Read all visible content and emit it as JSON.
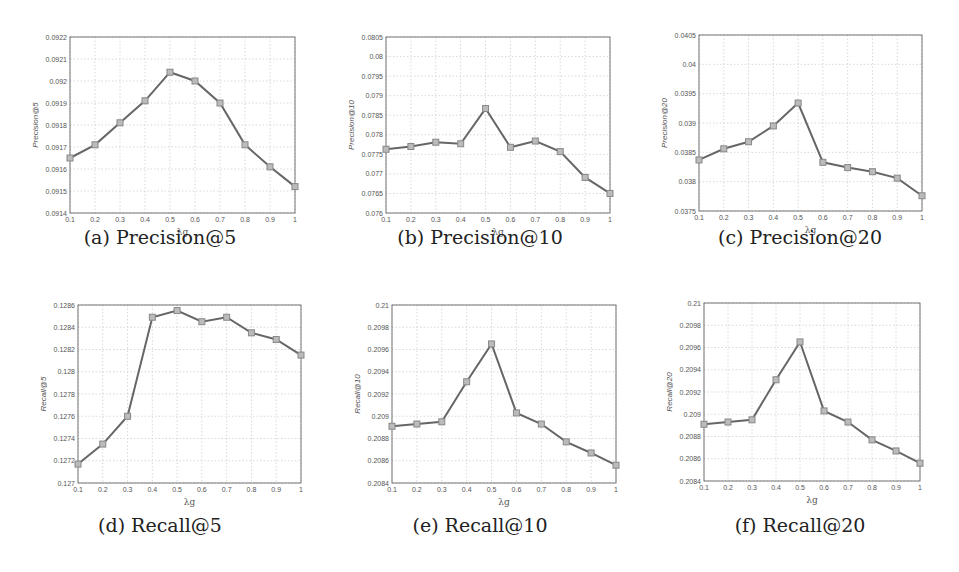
{
  "figure": {
    "x_axis_label": "λg",
    "x_ticks": [
      "0.1",
      "0.2",
      "0.3",
      "0.4",
      "0.5",
      "0.6",
      "0.7",
      "0.8",
      "0.9",
      "1"
    ],
    "line_color": "#666666",
    "marker_color": "#888888"
  },
  "chart_data": [
    {
      "type": "line",
      "caption": "(a) Precision@5",
      "title": "",
      "xlabel": "λg",
      "ylabel": "Precision@5",
      "x": [
        0.1,
        0.2,
        0.3,
        0.4,
        0.5,
        0.6,
        0.7,
        0.8,
        0.9,
        1.0
      ],
      "values": [
        0.09165,
        0.09171,
        0.09181,
        0.09191,
        0.09204,
        0.092,
        0.0919,
        0.09171,
        0.09161,
        0.09152
      ],
      "ylim": [
        0.0914,
        0.0922
      ],
      "y_ticks": [
        "0.0914",
        "0.0915",
        "0.0916",
        "0.0917",
        "0.0918",
        "0.0919",
        "0.092",
        "0.0921",
        "0.0922"
      ],
      "grid": true,
      "marker": "square"
    },
    {
      "type": "line",
      "caption": "(b) Precision@10",
      "title": "",
      "xlabel": "λg",
      "ylabel": "Precision@10",
      "x": [
        0.1,
        0.2,
        0.3,
        0.4,
        0.5,
        0.6,
        0.7,
        0.8,
        0.9,
        1.0
      ],
      "values": [
        0.07763,
        0.0777,
        0.07781,
        0.07777,
        0.07867,
        0.07768,
        0.07784,
        0.07757,
        0.07691,
        0.0765
      ],
      "ylim": [
        0.076,
        0.0805
      ],
      "y_ticks": [
        "0.076",
        "0.0765",
        "0.077",
        "0.0775",
        "0.078",
        "0.0785",
        "0.079",
        "0.0795",
        "0.08",
        "0.0805"
      ],
      "grid": true,
      "marker": "square"
    },
    {
      "type": "line",
      "caption": "(c) Precision@20",
      "title": "",
      "xlabel": "λg",
      "ylabel": "Precision@20",
      "x": [
        0.1,
        0.2,
        0.3,
        0.4,
        0.5,
        0.6,
        0.7,
        0.8,
        0.9,
        1.0
      ],
      "values": [
        0.03837,
        0.03856,
        0.03868,
        0.03895,
        0.03934,
        0.03833,
        0.03824,
        0.03817,
        0.03806,
        0.03776
      ],
      "ylim": [
        0.0375,
        0.0405
      ],
      "y_ticks": [
        "0.0375",
        "0.038",
        "0.0385",
        "0.039",
        "0.0395",
        "0.04",
        "0.0405"
      ],
      "grid": true,
      "marker": "square"
    },
    {
      "type": "line",
      "caption": "(d) Recall@5",
      "title": "",
      "xlabel": "λg",
      "ylabel": "Recall@5",
      "x": [
        0.1,
        0.2,
        0.3,
        0.4,
        0.5,
        0.6,
        0.7,
        0.8,
        0.9,
        1.0
      ],
      "values": [
        0.12717,
        0.12735,
        0.1276,
        0.12849,
        0.12855,
        0.12845,
        0.12849,
        0.12835,
        0.12829,
        0.12815
      ],
      "ylim": [
        0.127,
        0.1286
      ],
      "y_ticks": [
        "0.127",
        "0.1272",
        "0.1274",
        "0.1276",
        "0.1278",
        "0.128",
        "0.1282",
        "0.1284",
        "0.1286"
      ],
      "grid": true,
      "marker": "square"
    },
    {
      "type": "line",
      "caption": "(e) Recall@10",
      "title": "",
      "xlabel": "λg",
      "ylabel": "Recall@10",
      "x": [
        0.1,
        0.2,
        0.3,
        0.4,
        0.5,
        0.6,
        0.7,
        0.8,
        0.9,
        1.0
      ],
      "values": [
        0.20891,
        0.20893,
        0.20895,
        0.20931,
        0.20965,
        0.20903,
        0.20893,
        0.20877,
        0.20867,
        0.20856
      ],
      "ylim": [
        0.2084,
        0.21
      ],
      "y_ticks": [
        "0.2084",
        "0.2086",
        "0.2088",
        "0.209",
        "0.2092",
        "0.2094",
        "0.2096",
        "0.2098",
        "0.21"
      ],
      "grid": true,
      "marker": "square"
    },
    {
      "type": "line",
      "caption": "(f) Recall@20",
      "title": "",
      "xlabel": "λg",
      "ylabel": "Recall@20",
      "x": [
        0.1,
        0.2,
        0.3,
        0.4,
        0.5,
        0.6,
        0.7,
        0.8,
        0.9,
        1.0
      ],
      "values": [
        0.20891,
        0.20893,
        0.20895,
        0.20931,
        0.20965,
        0.20903,
        0.20893,
        0.20877,
        0.20867,
        0.20856
      ],
      "ylim": [
        0.2084,
        0.21
      ],
      "y_ticks": [
        "0.2084",
        "0.2086",
        "0.2088",
        "0.209",
        "0.2092",
        "0.2094",
        "0.2096",
        "0.2098",
        "0.21"
      ],
      "grid": true,
      "marker": "square"
    }
  ],
  "layout": {
    "panels": [
      {
        "left": 0,
        "top": 0,
        "plot": {
          "x": 70,
          "y": 37,
          "w": 225,
          "h": 176
        },
        "caption_top": 226
      },
      {
        "left": 320,
        "top": 0,
        "plot": {
          "x": 66,
          "y": 37,
          "w": 224,
          "h": 176
        },
        "caption_top": 226
      },
      {
        "left": 640,
        "top": 0,
        "plot": {
          "x": 59,
          "y": 35,
          "w": 223,
          "h": 176
        },
        "caption_top": 226
      },
      {
        "left": 0,
        "top": 290,
        "plot": {
          "x": 78,
          "y": 15,
          "w": 223,
          "h": 178
        },
        "caption_top": 224
      },
      {
        "left": 320,
        "top": 290,
        "plot": {
          "x": 72,
          "y": 15,
          "w": 224,
          "h": 178
        },
        "caption_top": 224
      },
      {
        "left": 640,
        "top": 290,
        "plot": {
          "x": 64,
          "y": 13,
          "w": 216,
          "h": 178
        },
        "caption_top": 224
      }
    ]
  }
}
